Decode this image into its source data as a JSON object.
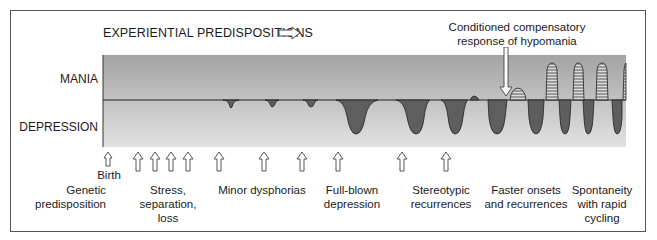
{
  "diagram": {
    "title": "EXPERIENTIAL PREDISPOSITIONS",
    "title_arrow_icon": "hollow-right-arrow",
    "y_labels": {
      "top": "MANIA",
      "bottom": "DEPRESSION"
    },
    "annotation": {
      "line1": "Conditioned compensatory",
      "line2": "response of hypomania",
      "icon": "hollow-down-arrow"
    },
    "birth_label": "Birth",
    "stages": [
      {
        "id": "genetic",
        "lines": [
          "Genetic",
          "predisposition"
        ]
      },
      {
        "id": "stress",
        "lines": [
          "Stress,",
          "separation,",
          "loss"
        ]
      },
      {
        "id": "minor",
        "lines": [
          "Minor dysphorias"
        ]
      },
      {
        "id": "fullblown",
        "lines": [
          "Full-blown",
          "depression"
        ]
      },
      {
        "id": "stereotypic",
        "lines": [
          "Stereotypic",
          "recurrences"
        ]
      },
      {
        "id": "faster",
        "lines": [
          "Faster onsets",
          "and recurrences"
        ]
      },
      {
        "id": "spontaneity",
        "lines": [
          "Spontaneity",
          "with rapid",
          "cycling"
        ]
      }
    ],
    "event_arrows_x": [
      108,
      138,
      155,
      171,
      188,
      219,
      264,
      302,
      338,
      402,
      446
    ],
    "colors": {
      "depression_fill": "#5e5e5e",
      "band_top": "#a8a8a8",
      "band_bottom": "#e0e0e0",
      "mania_hatch": "#3a3a3a"
    }
  }
}
